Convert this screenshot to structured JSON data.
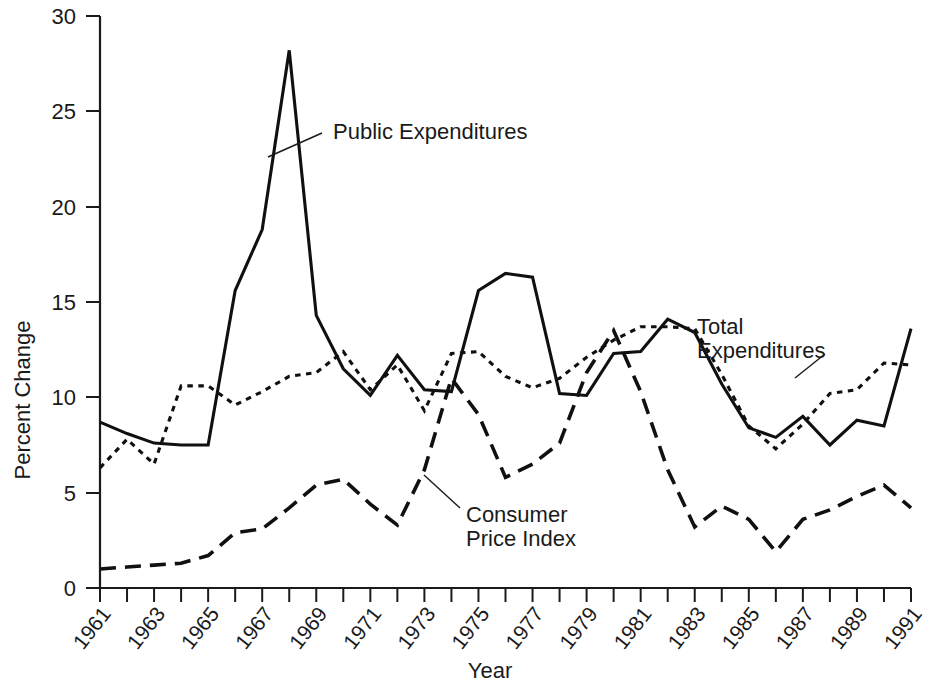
{
  "chart_data": {
    "type": "line",
    "title": "",
    "xlabel": "Year",
    "ylabel": "Percent Change",
    "xlim": [
      1961,
      1991
    ],
    "ylim": [
      0,
      30
    ],
    "grid": false,
    "legend_position": "inline-annotations",
    "yticks": [
      0,
      5,
      10,
      15,
      20,
      25,
      30
    ],
    "ytick_labels": [
      "0",
      "5",
      "10",
      "15",
      "20",
      "25",
      "30"
    ],
    "xticks": [
      1961,
      1962,
      1963,
      1964,
      1965,
      1966,
      1967,
      1968,
      1969,
      1970,
      1971,
      1972,
      1973,
      1974,
      1975,
      1976,
      1977,
      1978,
      1979,
      1980,
      1981,
      1982,
      1983,
      1984,
      1985,
      1986,
      1987,
      1988,
      1989,
      1990,
      1991
    ],
    "xtick_labels": [
      "1961",
      "",
      "1963",
      "",
      "1965",
      "",
      "1967",
      "",
      "1969",
      "",
      "1971",
      "",
      "1973",
      "",
      "1975",
      "",
      "1977",
      "",
      "1979",
      "",
      "1981",
      "",
      "1983",
      "",
      "1985",
      "",
      "1987",
      "",
      "1989",
      "",
      "1991"
    ],
    "xtick_labels_shown": [
      "1961",
      "1963",
      "1965",
      "1967",
      "1969",
      "1971",
      "1973",
      "1975",
      "1977",
      "1979",
      "1981",
      "1983",
      "1985",
      "1987",
      "1989",
      "1991"
    ],
    "x": [
      1961,
      1962,
      1963,
      1964,
      1965,
      1966,
      1967,
      1968,
      1969,
      1970,
      1971,
      1972,
      1973,
      1974,
      1975,
      1976,
      1977,
      1978,
      1979,
      1980,
      1981,
      1982,
      1983,
      1984,
      1985,
      1986,
      1987,
      1988,
      1989,
      1990,
      1991
    ],
    "series": [
      {
        "name": "Public Expenditures",
        "style": "solid",
        "color": "#101010",
        "values": [
          8.7,
          8.1,
          7.6,
          7.5,
          7.5,
          15.6,
          18.8,
          28.2,
          14.3,
          11.5,
          10.1,
          12.2,
          10.4,
          10.3,
          15.6,
          16.5,
          16.3,
          10.2,
          10.1,
          12.3,
          12.4,
          14.1,
          13.4,
          10.7,
          8.4,
          7.9,
          9.0,
          7.5,
          8.8,
          8.5,
          13.6
        ]
      },
      {
        "name": "Total Expenditures",
        "style": "dotted",
        "color": "#101010",
        "values": [
          6.3,
          7.8,
          6.5,
          10.6,
          10.6,
          9.6,
          10.3,
          11.1,
          11.3,
          12.4,
          10.4,
          11.7,
          9.3,
          12.3,
          12.4,
          11.1,
          10.5,
          11.0,
          12.1,
          13.0,
          13.7,
          13.7,
          13.6,
          11.2,
          8.5,
          7.3,
          8.6,
          10.2,
          10.4,
          11.8,
          11.7
        ]
      },
      {
        "name": "Consumer Price Index",
        "style": "dashed",
        "color": "#101010",
        "values": [
          1.0,
          1.1,
          1.2,
          1.3,
          1.7,
          2.9,
          3.1,
          4.2,
          5.4,
          5.7,
          4.4,
          3.3,
          6.2,
          11.0,
          9.1,
          5.8,
          6.5,
          7.6,
          11.3,
          13.5,
          10.3,
          6.2,
          3.2,
          4.3,
          3.6,
          1.9,
          3.6,
          4.1,
          4.8,
          5.4,
          4.2
        ]
      }
    ],
    "annotations": [
      {
        "id": "public-expenditures",
        "text": "Public Expenditures",
        "lines": [
          "Public Expenditures"
        ]
      },
      {
        "id": "total-expenditures",
        "text": "Total Expenditures",
        "lines": [
          "Total",
          "Expenditures"
        ]
      },
      {
        "id": "consumer-price-index",
        "text": "Consumer Price Index",
        "lines": [
          "Consumer",
          "Price Index"
        ]
      }
    ]
  }
}
